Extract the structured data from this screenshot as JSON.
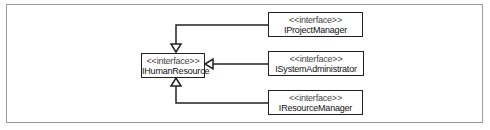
{
  "diagram": {
    "type": "UML class diagram - interface inheritance",
    "base_interface": {
      "stereotype": "<<interface>>",
      "name": "IHumanResource"
    },
    "derived_interfaces": [
      {
        "stereotype": "<<interface>>",
        "name": "IProjectManager"
      },
      {
        "stereotype": "<<interface>>",
        "name": "ISystemAdministrator"
      },
      {
        "stereotype": "<<interface>>",
        "name": "IResourceManager"
      }
    ],
    "relationships": [
      {
        "from": "IProjectManager",
        "to": "IHumanResource",
        "kind": "generalization"
      },
      {
        "from": "ISystemAdministrator",
        "to": "IHumanResource",
        "kind": "generalization"
      },
      {
        "from": "IResourceManager",
        "to": "IHumanResource",
        "kind": "generalization"
      }
    ],
    "colors": {
      "line": "#222222",
      "frame": "#9a9a9a",
      "background": "#ffffff"
    }
  }
}
